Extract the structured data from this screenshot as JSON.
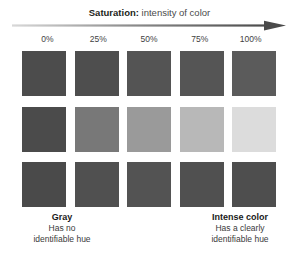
{
  "header": {
    "title_lead": "Saturation:",
    "title_rest": " intensity of color",
    "arrow_icon": "right-arrow-icon",
    "arrow_color_start": "#d6d6d6",
    "arrow_color_end": "#4a4a4a"
  },
  "scale": {
    "ticks": [
      {
        "label": "0%"
      },
      {
        "label": "25%"
      },
      {
        "label": "50%"
      },
      {
        "label": "75%"
      },
      {
        "label": "100%"
      }
    ]
  },
  "grid": {
    "rows": [
      {
        "name": "row-top",
        "swatches": [
          {
            "percent": "0%",
            "color": "#4c4c4c"
          },
          {
            "percent": "25%",
            "color": "#4e4e4e"
          },
          {
            "percent": "50%",
            "color": "#545454"
          },
          {
            "percent": "75%",
            "color": "#555555"
          },
          {
            "percent": "100%",
            "color": "#5b5b5b"
          }
        ]
      },
      {
        "name": "row-middle",
        "swatches": [
          {
            "percent": "0%",
            "color": "#4b4b4b"
          },
          {
            "percent": "25%",
            "color": "#787878"
          },
          {
            "percent": "50%",
            "color": "#9a9a9a"
          },
          {
            "percent": "75%",
            "color": "#b8b8b8"
          },
          {
            "percent": "100%",
            "color": "#dcdcdc"
          }
        ]
      },
      {
        "name": "row-bottom",
        "swatches": [
          {
            "percent": "0%",
            "color": "#4a4a4a"
          },
          {
            "percent": "25%",
            "color": "#505050"
          },
          {
            "percent": "50%",
            "color": "#535353"
          },
          {
            "percent": "75%",
            "color": "#505050"
          },
          {
            "percent": "100%",
            "color": "#4e4e4e"
          }
        ]
      }
    ]
  },
  "captions": {
    "left": {
      "title": "Gray",
      "line1": "Has no",
      "line2": "identifiable hue"
    },
    "right": {
      "title": "Intense color",
      "line1": "Has a clearly",
      "line2": "identifiable hue"
    }
  }
}
